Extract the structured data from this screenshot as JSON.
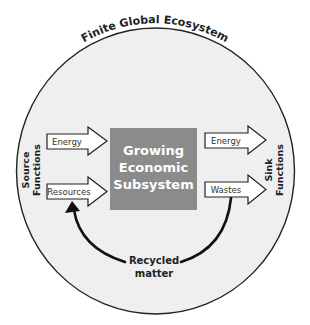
{
  "title": "Finite Global Ecosystem",
  "central_box": {
    "lines": [
      "Growing",
      "Economic",
      "Subsystem"
    ],
    "color": "#8b8b8b",
    "text_color": "#ffffff"
  },
  "source_functions": {
    "lines": [
      "Source",
      "Functions"
    ],
    "arrows": [
      {
        "label": "Energy"
      },
      {
        "label": "Resources"
      }
    ]
  },
  "sink_functions": {
    "lines": [
      "Sink",
      "Functions"
    ],
    "arrows": [
      {
        "label": "Energy"
      },
      {
        "label": "Wastes"
      }
    ]
  },
  "recycle": {
    "lines": [
      "Recycled",
      "matter"
    ]
  },
  "colors": {
    "ecosystem_fill": "#efefef",
    "outline": "#222222",
    "arrow_fill": "#ffffff"
  }
}
